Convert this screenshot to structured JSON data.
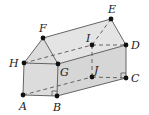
{
  "diagram": {
    "colors": {
      "face": "#d9d9d9",
      "edge": "#555555",
      "point": "#111111",
      "hidden": "#555555"
    },
    "points": [
      {
        "id": "A",
        "x": 23,
        "y": 95,
        "lx": 18,
        "ly": 109
      },
      {
        "id": "B",
        "x": 57,
        "y": 96,
        "lx": 53,
        "ly": 110
      },
      {
        "id": "C",
        "x": 126,
        "y": 78,
        "lx": 131,
        "ly": 82
      },
      {
        "id": "D",
        "x": 126,
        "y": 45,
        "lx": 131,
        "ly": 49
      },
      {
        "id": "E",
        "x": 111,
        "y": 19,
        "lx": 107,
        "ly": 13
      },
      {
        "id": "F",
        "x": 43,
        "y": 38,
        "lx": 39,
        "ly": 32
      },
      {
        "id": "G",
        "x": 58,
        "y": 64,
        "lx": 60,
        "ly": 76
      },
      {
        "id": "H",
        "x": 24,
        "y": 63,
        "lx": 9,
        "ly": 67
      },
      {
        "id": "I",
        "x": 92,
        "y": 45,
        "lx": 85,
        "ly": 42
      },
      {
        "id": "J",
        "x": 92,
        "y": 77,
        "lx": 93,
        "ly": 73
      }
    ]
  }
}
